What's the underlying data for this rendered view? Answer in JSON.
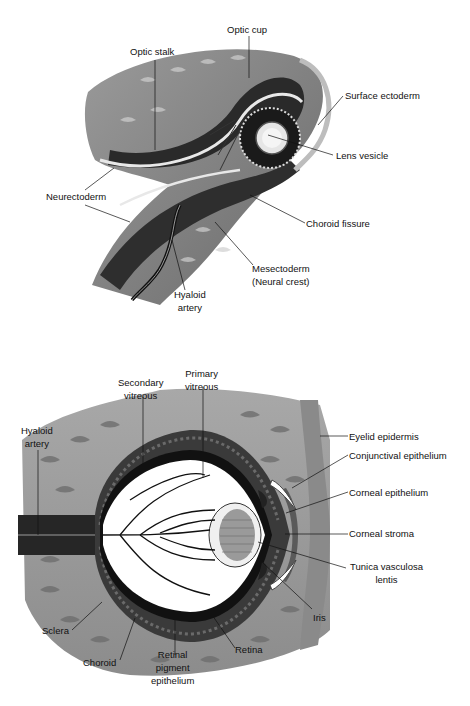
{
  "figures": [
    {
      "id": "optic-cup-development",
      "labels": {
        "optic_cup": "Optic cup",
        "optic_stalk": "Optic stalk",
        "surface_ectoderm": "Surface ectoderm",
        "lens_vesicle": "Lens vesicle",
        "neurectoderm": "Neurectoderm",
        "choroid_fissure": "Choroid fissure",
        "mesectoderm_1": "Mesectoderm",
        "mesectoderm_2": "(Neural crest)",
        "hyaloid_artery_1": "Hyaloid",
        "hyaloid_artery_2": "artery"
      }
    },
    {
      "id": "fetal-eye-section",
      "labels": {
        "secondary_vitreous_1": "Secondary",
        "secondary_vitreous_2": "vitreous",
        "primary_vitreous_1": "Primary",
        "primary_vitreous_2": "vitreous",
        "hyaloid_artery_1": "Hyaloid",
        "hyaloid_artery_2": "artery",
        "eyelid_epidermis": "Eyelid epidermis",
        "conjunctival_epithelium": "Conjunctival epithelium",
        "corneal_epithelium": "Corneal epithelium",
        "corneal_stroma": "Corneal stroma",
        "tunica_vasculosa_1": "Tunica vasculosa",
        "tunica_vasculosa_2": "lentis",
        "iris": "Iris",
        "sclera": "Sclera",
        "choroid": "Choroid",
        "retinal_pigment_1": "Retinal",
        "retinal_pigment_2": "pigment",
        "retinal_pigment_3": "epithelium",
        "retina": "Retina"
      }
    }
  ]
}
